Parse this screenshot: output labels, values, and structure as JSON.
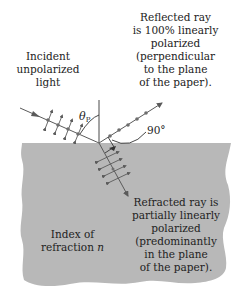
{
  "diagram": {
    "colors": {
      "medium_fill": "#b8b8b8",
      "ray_stroke": "#5a5a5a",
      "dot_fill": "#6e6e6e",
      "text": "#222222",
      "background": "#ffffff"
    },
    "labels": {
      "incident": "Incident\nunpolarized\nlight",
      "reflected": "Reflected ray\nis 100% linearly\npolarized\n(perpendicular\nto the plane\nof the paper).",
      "refracted": "Refracted ray is\npartially linearly\npolarized\n(predominantly\nin the plane\nof the paper).",
      "index_prefix": "Index of\nrefraction ",
      "index_symbol": "n",
      "angle_symbol": "θ",
      "angle_subscript": "P",
      "right_angle": "90°"
    },
    "elements": {
      "incident_ray": {
        "from": [
          20,
          108
        ],
        "to": [
          99,
          143
        ],
        "polarization": "both (dots + double arrows)"
      },
      "reflected_ray": {
        "from": [
          99,
          143
        ],
        "to": [
          162,
          103
        ],
        "polarization": "dots (perpendicular to page)"
      },
      "refracted_ray": {
        "from": [
          99,
          143
        ],
        "to": [
          128,
          196
        ],
        "polarization": "mostly double arrows (in page)"
      },
      "normal_line": {
        "from": [
          99,
          100
        ],
        "to": [
          99,
          143
        ]
      },
      "interface_y": 143
    }
  }
}
